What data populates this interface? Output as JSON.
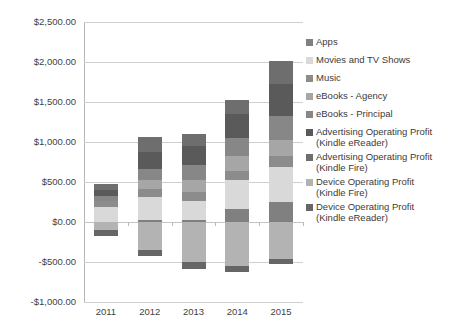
{
  "chart_data": {
    "type": "bar",
    "subtype": "stacked-bar",
    "title": "",
    "subtitle": "",
    "xlabel": "",
    "ylabel": "",
    "categories": [
      "2011",
      "2012",
      "2013",
      "2014",
      "2015"
    ],
    "ylim": [
      -1000,
      2500
    ],
    "ytick_step": 500,
    "ytick_labels": [
      "$2,500.00",
      "$2,000.00",
      "$1,500.00",
      "$1,000.00",
      "$500.00",
      "$0.00",
      "-$500.00",
      "-$1,000.00"
    ],
    "ytick_values": [
      2500,
      2000,
      1500,
      1000,
      500,
      0,
      -500,
      -1000
    ],
    "grid": true,
    "legend_position": "right",
    "currency": "USD",
    "units": "millions",
    "series": [
      {
        "name": "Apps",
        "color": "#808080",
        "values": [
          0,
          25,
          30,
          160,
          250
        ]
      },
      {
        "name": "Movies and TV Shows",
        "color": "#d9d9d9",
        "values": [
          185,
          290,
          230,
          360,
          440
        ]
      },
      {
        "name": "Music",
        "color": "#8c8c8c",
        "values": [
          75,
          100,
          110,
          120,
          130
        ]
      },
      {
        "name": "eBooks - Agency",
        "color": "#a6a6a6",
        "values": [
          0,
          110,
          150,
          180,
          210
        ]
      },
      {
        "name": "eBooks - Principal",
        "color": "#878787",
        "values": [
          60,
          140,
          190,
          230,
          300
        ]
      },
      {
        "name": "Advertising Operating Profit (Kindle eReader)",
        "color": "#5a5a5a",
        "values": [
          85,
          215,
          245,
          300,
          390
        ]
      },
      {
        "name": "Advertising Operating Profit (Kindle Fire)",
        "color": "#6e6e6e",
        "values": [
          75,
          180,
          150,
          175,
          290
        ]
      },
      {
        "name": "Device Operating Profit (Kindle Fire)",
        "color": "#b3b3b3",
        "values": [
          -100,
          -350,
          -500,
          -545,
          -460
        ]
      },
      {
        "name": "Device Operating Profit (Kindle eReader)",
        "color": "#666666",
        "values": [
          -75,
          -80,
          -90,
          -75,
          -70
        ]
      }
    ],
    "totals_positive": [
      480,
      1060,
      1105,
      1525,
      2010
    ],
    "totals_negative": [
      -175,
      -430,
      -590,
      -620,
      -530
    ]
  },
  "legend": {
    "items": [
      {
        "label": "Apps",
        "swatch": "#808080",
        "wrap": false
      },
      {
        "label": "Movies and TV Shows",
        "swatch": "#d9d9d9",
        "wrap": false
      },
      {
        "label": "Music",
        "swatch": "#8c8c8c",
        "wrap": false
      },
      {
        "label": "eBooks - Agency",
        "swatch": "#a6a6a6",
        "wrap": false
      },
      {
        "label": "eBooks - Principal",
        "swatch": "#878787",
        "wrap": false
      },
      {
        "label": "Advertising Operating Profit\n(Kindle eReader)",
        "swatch": "#5a5a5a",
        "wrap": true
      },
      {
        "label": "Advertising Operating Profit\n(Kindle Fire)",
        "swatch": "#6e6e6e",
        "wrap": true
      },
      {
        "label": "Device Operating Profit\n(Kindle Fire)",
        "swatch": "#b3b3b3",
        "wrap": true
      },
      {
        "label": "Device Operating Profit\n(Kindle eReader)",
        "swatch": "#666666",
        "wrap": true
      }
    ]
  },
  "axis": {
    "gridline_color": "#cfcfcf",
    "axis_color": "#b6b6b6"
  }
}
